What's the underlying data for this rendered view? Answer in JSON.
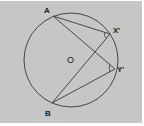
{
  "figure": {
    "type": "circle-geometry",
    "background_color": "#c6c6c6",
    "stroke_color": "#3a3a3a",
    "center": {
      "label": "O",
      "x": 71,
      "y": 60
    },
    "radius": 47,
    "points": [
      {
        "label": "A",
        "x": 53,
        "y": 16,
        "lx": 44,
        "ly": 13
      },
      {
        "label": "X'",
        "x": 110,
        "y": 34,
        "lx": 113,
        "ly": 33
      },
      {
        "label": "Y'",
        "x": 115,
        "y": 69,
        "lx": 117,
        "ly": 72
      },
      {
        "label": "B",
        "x": 52,
        "y": 103,
        "lx": 45,
        "ly": 116
      }
    ],
    "segments": [
      [
        "A",
        "X'"
      ],
      [
        "A",
        "Y'"
      ],
      [
        "B",
        "X'"
      ],
      [
        "B",
        "Y'"
      ]
    ],
    "angle_marks": [
      "X'",
      "Y'"
    ]
  }
}
